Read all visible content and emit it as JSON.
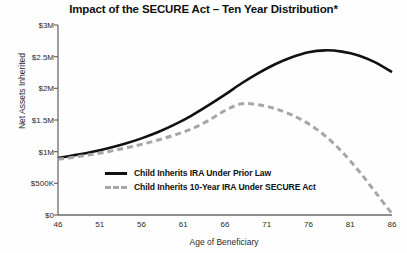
{
  "chart_data": {
    "type": "line",
    "title": "Impact of the SECURE Act – Ten Year Distribution*",
    "xlabel": "Age of Beneficiary",
    "ylabel": "Net Assets Inherited",
    "xlim": [
      46,
      86
    ],
    "ylim": [
      0,
      3000000
    ],
    "grid": false,
    "legend_position": "inside-center",
    "xticks": [
      46,
      51,
      56,
      61,
      66,
      71,
      76,
      81,
      86
    ],
    "xtick_labels": [
      "46",
      "51",
      "56",
      "61",
      "66",
      "71",
      "76",
      "81",
      "86"
    ],
    "yticks": [
      0,
      500000,
      1000000,
      1500000,
      2000000,
      2500000,
      3000000
    ],
    "ytick_labels": [
      "$0",
      "$500K",
      "$1M",
      "$1.5M",
      "$2M",
      "$2.5M",
      "$3M"
    ],
    "series": [
      {
        "name": "Child Inherits IRA Under Prior Law",
        "style": "solid",
        "color": "#111111",
        "x": [
          46,
          48,
          50,
          52,
          54,
          56,
          58,
          60,
          62,
          64,
          66,
          68,
          70,
          72,
          74,
          76,
          78,
          80,
          82,
          84,
          86
        ],
        "values": [
          900000,
          945000,
          995000,
          1055000,
          1125000,
          1210000,
          1310000,
          1430000,
          1570000,
          1730000,
          1900000,
          2080000,
          2240000,
          2380000,
          2490000,
          2570000,
          2600000,
          2580000,
          2520000,
          2410000,
          2255000
        ]
      },
      {
        "name": "Child Inherits 10-Year IRA Under SECURE Act",
        "style": "dashed",
        "color": "#a6a6a6",
        "x": [
          46,
          48,
          50,
          52,
          54,
          56,
          58,
          60,
          62,
          64,
          66,
          68,
          70,
          72,
          74,
          76,
          78,
          80,
          82,
          84,
          86
        ],
        "values": [
          880000,
          915000,
          955000,
          1000000,
          1055000,
          1115000,
          1185000,
          1265000,
          1360000,
          1490000,
          1650000,
          1755000,
          1740000,
          1680000,
          1580000,
          1440000,
          1250000,
          1000000,
          700000,
          360000,
          20000
        ]
      }
    ]
  },
  "legend": {
    "items": [
      {
        "label": "Child Inherits IRA Under Prior Law"
      },
      {
        "label": "Child Inherits 10-Year IRA Under SECURE Act"
      }
    ]
  },
  "colors": {
    "prior_law": "#111111",
    "secure_act": "#a6a6a6",
    "axis": "#6a6a6a",
    "background": "#fefefe"
  }
}
